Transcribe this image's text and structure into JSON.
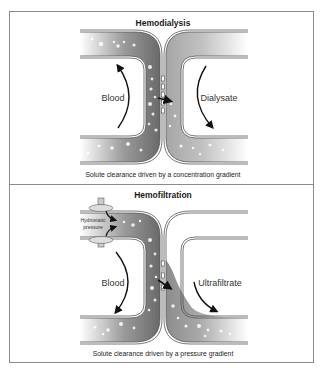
{
  "figure": {
    "panels": [
      {
        "id": "hemodialysis",
        "title": "Hemodialysis",
        "left_label": "Blood",
        "right_label": "Dialysate",
        "caption": "Solute clearance driven by a concentration gradient"
      },
      {
        "id": "hemofiltration",
        "title": "Hemofiltration",
        "left_label": "Blood",
        "right_label": "Ultrafiltrate",
        "pressure_label_line1": "Hydrostatic",
        "pressure_label_line2": "pressure",
        "caption": "Solute clearance driven by a pressure gradient"
      }
    ],
    "colors": {
      "border": "#8a8a8a",
      "blood_dark": "#6e6e6e",
      "dialysate": "#a9a9a9",
      "tube_wall": "#555555",
      "arrow": "#111111"
    }
  }
}
